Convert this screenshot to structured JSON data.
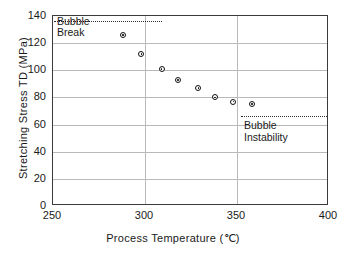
{
  "chart_data": {
    "type": "scatter",
    "title": "",
    "xlabel": "Process  Temperature  (°C)",
    "ylabel": "Stretching  Stress  TD  (MPa)",
    "xlim": [
      250,
      400
    ],
    "ylim": [
      0,
      140
    ],
    "xticks": [
      250,
      300,
      350,
      400
    ],
    "yticks": [
      0,
      20,
      40,
      60,
      80,
      100,
      120,
      140
    ],
    "grid": true,
    "legend": "none",
    "series": [
      {
        "name": "Stretching Stress TD",
        "x": [
          288,
          298,
          309,
          318,
          329,
          338,
          348,
          358
        ],
        "y": [
          126,
          112,
          101,
          93,
          87,
          80,
          77,
          75
        ]
      }
    ],
    "annotations": [
      {
        "label": "Bubble\nBreak",
        "line_y": 129,
        "line_x_start": 250,
        "line_x_end": 309,
        "text_x": 253,
        "text_y": 137
      },
      {
        "label": "Bubble\nInstability",
        "line_y": 67,
        "line_x_start": 352,
        "line_x_end": 399,
        "text_x": 355,
        "text_y": 62
      }
    ]
  },
  "labels": {
    "xaxis_title": "Process  Temperature  (℃)",
    "yaxis_title": "Stretching  Stress  TD  (MPa)",
    "yticks": [
      "140",
      "120",
      "100",
      "80",
      "60",
      "40",
      "20",
      "0"
    ],
    "xticks": [
      "250",
      "300",
      "350",
      "400"
    ],
    "annotation_bubble_break_line1": "Bubble",
    "annotation_bubble_break_line2": "Break",
    "annotation_bubble_instability_line1": "Bubble",
    "annotation_bubble_instability_line2": "Instability"
  },
  "colors": {
    "background": "#ffffff",
    "frame": "#3a3a3a",
    "grid": "#b9b9b9",
    "marker": "#111111",
    "text": "#1a1a1a"
  }
}
